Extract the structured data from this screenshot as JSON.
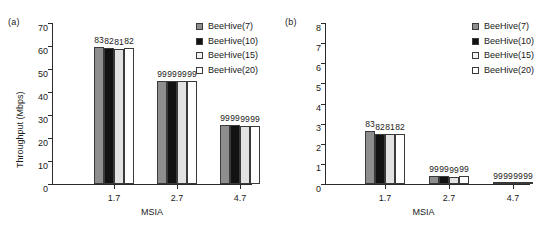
{
  "figure": {
    "series_names": [
      "BeeHive(7)",
      "BeeHive(10)",
      "BeeHive(15)",
      "BeeHive(20)"
    ],
    "series_colors": [
      "#8e8e8e",
      "#121212",
      "#e2e2e2",
      "#ffffff"
    ]
  },
  "chart_data": [
    {
      "type": "bar",
      "panel_tag": "(a)",
      "title": "",
      "xlabel": "MSIA",
      "ylabel": "Throughput (Mbps)",
      "categories": [
        "1.7",
        "2.7",
        "4.7"
      ],
      "ylim": [
        0,
        70
      ],
      "yticks": [
        0,
        10,
        20,
        30,
        40,
        50,
        60,
        70
      ],
      "ytick_labels": [
        "0",
        "10",
        "20",
        "30",
        "40",
        "50",
        "60",
        "70"
      ],
      "grid": false,
      "legend_position": "upper right",
      "series": [
        {
          "name": "BeeHive(7)",
          "values": [
            59.5,
            45.0,
            25.7
          ],
          "color": "#8e8e8e"
        },
        {
          "name": "BeeHive(10)",
          "values": [
            59.3,
            45.0,
            25.6
          ],
          "color": "#121212"
        },
        {
          "name": "BeeHive(15)",
          "values": [
            58.8,
            44.7,
            25.4
          ],
          "color": "#e2e2e2"
        },
        {
          "name": "BeeHive(20)",
          "values": [
            59.0,
            44.8,
            25.4
          ],
          "color": "#ffffff"
        }
      ],
      "bar_labels": [
        [
          "83",
          "82",
          "81",
          "82"
        ],
        [
          "99",
          "99",
          "99",
          "99"
        ],
        [
          "99",
          "99",
          "99",
          "99"
        ]
      ]
    },
    {
      "type": "bar",
      "panel_tag": "(b)",
      "title": "",
      "xlabel": "MSIA",
      "ylabel": "90th percentile of packet delays (sec)",
      "categories": [
        "1.7",
        "2.7",
        "4.7"
      ],
      "ylim": [
        0,
        8
      ],
      "yticks": [
        0,
        1,
        2,
        3,
        4,
        5,
        6,
        7,
        8
      ],
      "ytick_labels": [
        "0",
        "1",
        "2",
        "3",
        "4",
        "5",
        "6",
        "7",
        "8"
      ],
      "grid": false,
      "legend_position": "upper right",
      "series": [
        {
          "name": "BeeHive(7)",
          "values": [
            2.65,
            0.38,
            0.07
          ],
          "color": "#8e8e8e"
        },
        {
          "name": "BeeHive(10)",
          "values": [
            2.5,
            0.42,
            0.07
          ],
          "color": "#121212"
        },
        {
          "name": "BeeHive(15)",
          "values": [
            2.5,
            0.35,
            0.06
          ],
          "color": "#e2e2e2"
        },
        {
          "name": "BeeHive(20)",
          "values": [
            2.5,
            0.38,
            0.06
          ],
          "color": "#ffffff"
        }
      ],
      "bar_labels": [
        [
          "83",
          "82",
          "81",
          "82"
        ],
        [
          "99",
          "99",
          "99",
          "99"
        ],
        [
          "99",
          "99",
          "99",
          "99"
        ]
      ]
    }
  ]
}
